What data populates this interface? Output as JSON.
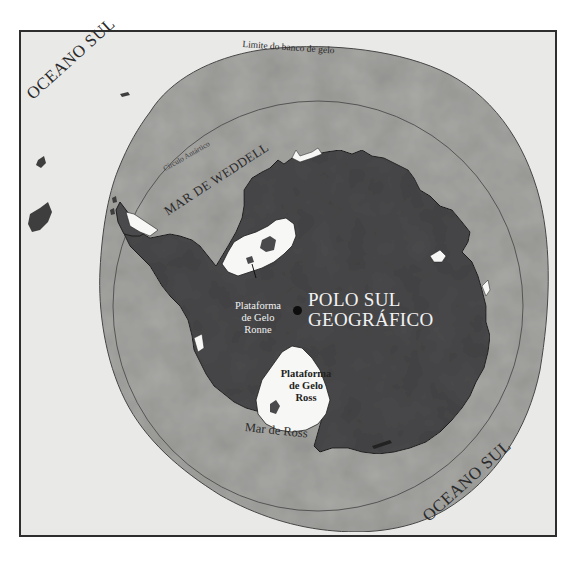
{
  "map": {
    "title": "Antártida",
    "labels": {
      "ocean_northwest": "OCEANO SUL",
      "ocean_southeast": "OCEANO SUL",
      "pack_ice_limit": "Limite do banco de gelo",
      "antarctic_circle": "Círculo Antártico",
      "weddell_sea": "MAR DE WEDDELL",
      "ross_sea": "Mar de Ross",
      "south_pole_line1": "POLO SUL",
      "south_pole_line2": "GEOGRÁFICO",
      "ronne_line1": "Plataforma",
      "ronne_line2": "de Gelo",
      "ronne_line3": "Ronne",
      "ross_shelf_line1": "Plataforma",
      "ross_shelf_line2": "de Gelo",
      "ross_shelf_line3": "Ross"
    },
    "colors": {
      "background": "#e9e9e7",
      "pack_ice": "#a9a9a6",
      "continent": "#4a4a4c",
      "ice_shelf": "#f7f7f5",
      "frame": "#2e2e2e",
      "lines": "#505050"
    }
  }
}
